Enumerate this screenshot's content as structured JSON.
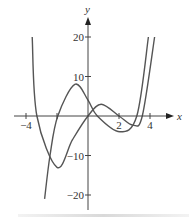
{
  "chart_data": {
    "type": "line",
    "title": "",
    "xlabel": "x",
    "ylabel": "y",
    "xlim": [
      -4.7,
      5.4
    ],
    "ylim": [
      -24,
      25
    ],
    "x_ticks": [
      -4,
      -2,
      2,
      4
    ],
    "x_tick_labels": [
      "−4",
      "",
      "2",
      "4"
    ],
    "y_ticks": [
      20,
      10,
      -10,
      -20
    ],
    "y_tick_labels": [
      "20",
      "10",
      "−10",
      "−20"
    ],
    "grid": false,
    "legend": null,
    "series": [
      {
        "name": "curve-1 (quartic through origin)",
        "color": "#555555",
        "points": [
          [
            -3.6,
            20
          ],
          [
            -3.3,
            0
          ],
          [
            -2.0,
            -13
          ],
          [
            -1.0,
            -6
          ],
          [
            0,
            0
          ],
          [
            0.85,
            3
          ],
          [
            2.0,
            0
          ],
          [
            2.9,
            -2.3
          ],
          [
            3.5,
            0
          ],
          [
            4.3,
            20
          ]
        ]
      },
      {
        "name": "curve-2 (cubic-like)",
        "color": "#555555",
        "points": [
          [
            -2.8,
            -21
          ],
          [
            -2.45,
            -10
          ],
          [
            -1.95,
            0
          ],
          [
            -0.85,
            8
          ],
          [
            0,
            4
          ],
          [
            0.6,
            0
          ],
          [
            2.05,
            -4
          ],
          [
            3.15,
            0
          ],
          [
            3.9,
            20
          ]
        ]
      }
    ]
  },
  "axes": {
    "x_label": "x",
    "y_label": "y",
    "origin_px": [
      88,
      116
    ],
    "scale_px": [
      15.5,
      3.95
    ]
  }
}
